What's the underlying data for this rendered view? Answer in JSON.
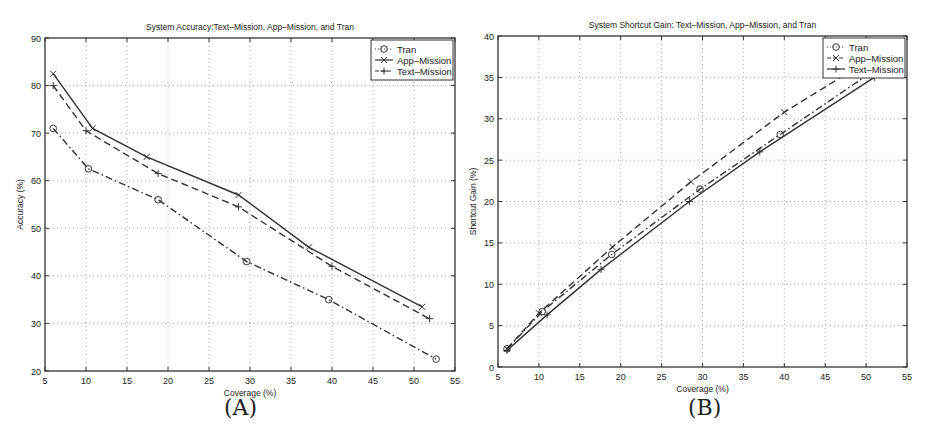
{
  "figure": {
    "panel_labels": [
      "(A)",
      "(B)"
    ]
  },
  "chart_data": [
    {
      "type": "line",
      "panel": "(A)",
      "title": "System Accuracy:Text–Mission, App–Mission, and Tran",
      "xlabel": "Coverage (%)",
      "ylabel": "Accuracy (%)",
      "xlim": [
        5,
        55
      ],
      "ylim": [
        20,
        90
      ],
      "xticks": [
        5,
        10,
        15,
        20,
        25,
        30,
        35,
        40,
        45,
        50,
        55
      ],
      "yticks": [
        20,
        30,
        40,
        50,
        60,
        70,
        80,
        90
      ],
      "grid": true,
      "legend_position": "upper right",
      "series": [
        {
          "name": "Tran",
          "line_style": "dash-dot",
          "marker": "circle",
          "x": [
            6.0,
            10.3,
            18.8,
            29.6,
            39.6,
            52.7
          ],
          "y": [
            71.0,
            62.5,
            56.0,
            43.0,
            35.0,
            22.5
          ]
        },
        {
          "name": "App–Mission",
          "line_style": "solid",
          "marker": "x",
          "x": [
            6.0,
            10.8,
            17.4,
            28.6,
            37.2,
            51.0
          ],
          "y": [
            82.5,
            71.0,
            65.0,
            57.0,
            46.0,
            33.5
          ]
        },
        {
          "name": "Text–Mission",
          "line_style": "dashed",
          "marker": "plus",
          "x": [
            6.0,
            10.0,
            18.8,
            28.6,
            40.0,
            51.9
          ],
          "y": [
            80.0,
            70.5,
            61.5,
            54.5,
            42.0,
            31.0
          ]
        }
      ]
    },
    {
      "type": "line",
      "panel": "(B)",
      "title": "System Shortcut Gain: Text–Mission, App–Mission, and Tran",
      "xlabel": "Coverage (%)",
      "ylabel": "Shortcut Gain (%)",
      "xlim": [
        5,
        55
      ],
      "ylim": [
        0,
        40
      ],
      "xticks": [
        5,
        10,
        15,
        20,
        25,
        30,
        35,
        40,
        45,
        50,
        55
      ],
      "yticks": [
        0,
        5,
        10,
        15,
        20,
        25,
        30,
        35,
        40
      ],
      "grid": true,
      "legend_position": "upper right",
      "series": [
        {
          "name": "Tran",
          "line_style": "dash-dot",
          "marker": "circle",
          "x": [
            6.1,
            10.4,
            18.9,
            29.7,
            39.5,
            52.7
          ],
          "y": [
            2.2,
            6.7,
            13.6,
            21.5,
            28.1,
            37.0
          ]
        },
        {
          "name": "App–Mission",
          "line_style": "dashed",
          "marker": "x",
          "x": [
            6.1,
            10.0,
            19.0,
            28.6,
            40.0,
            51.0
          ],
          "y": [
            2.2,
            6.5,
            14.5,
            22.4,
            30.8,
            37.5
          ]
        },
        {
          "name": "Text–Mission",
          "line_style": "solid",
          "marker": "plus",
          "x": [
            6.1,
            11.0,
            17.6,
            28.4,
            37.0,
            51.0
          ],
          "y": [
            2.0,
            6.3,
            11.8,
            20.0,
            26.0,
            35.0
          ]
        }
      ]
    }
  ]
}
